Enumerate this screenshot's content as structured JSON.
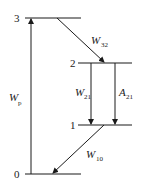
{
  "diagram": {
    "type": "energy-level-diagram",
    "levels": [
      {
        "id": "3",
        "label": "3"
      },
      {
        "id": "2",
        "label": "2"
      },
      {
        "id": "1",
        "label": "1"
      },
      {
        "id": "0",
        "label": "0"
      }
    ],
    "transitions": [
      {
        "id": "Wp",
        "symbol": "W",
        "subscript": "p",
        "from": "0",
        "to": "3",
        "kind": "pump"
      },
      {
        "id": "W32",
        "symbol": "W",
        "subscript": "32",
        "from": "3",
        "to": "2",
        "kind": "nonradiative"
      },
      {
        "id": "W21",
        "symbol": "W",
        "subscript": "21",
        "from": "2",
        "to": "1",
        "kind": "stimulated"
      },
      {
        "id": "A21",
        "symbol": "A",
        "subscript": "21",
        "from": "2",
        "to": "1",
        "kind": "spontaneous"
      },
      {
        "id": "W10",
        "symbol": "W",
        "subscript": "10",
        "from": "1",
        "to": "0",
        "kind": "nonradiative"
      }
    ],
    "line_color": "#1a1a1a"
  }
}
